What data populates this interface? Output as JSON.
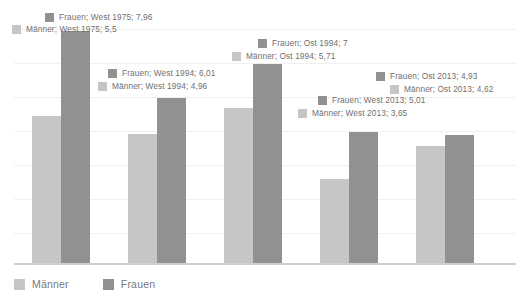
{
  "chart_data": {
    "type": "bar",
    "title": "",
    "subtitle": "",
    "xlabel": "",
    "ylabel": "",
    "grid": true,
    "legend_position": "bottom-left",
    "categories": [
      "West 1975",
      "West 1994",
      "Ost 1994",
      "West 2013",
      "Ost 2013"
    ],
    "series": [
      {
        "name": "Männer",
        "color": "#c6c6c6",
        "values": [
          5.5,
          4.96,
          5.71,
          3.65,
          4.62
        ],
        "value_labels": [
          "5,5",
          "4,96",
          "5,71",
          "3,65",
          "4,62"
        ]
      },
      {
        "name": "Frauen",
        "color": "#919191",
        "values": [
          7.96,
          6.01,
          7,
          5.01,
          4.93
        ],
        "value_labels": [
          "7,96",
          "6,01",
          "7",
          "5,01",
          "4,93"
        ]
      }
    ],
    "ylim": [
      1.2,
      8.0
    ],
    "annotations": [
      "Frauen; West 1975; 7,96",
      "Männer; West 1975; 5,5",
      "Frauen; West 1994; 6,01",
      "Männer; West 1994; 4,96",
      "Frauen; Ost 1994; 7",
      "Männer; Ost 1994; 5,71",
      "Frauen; West 2013; 5,01",
      "Männer; West 2013; 3,65",
      "Frauen; Ost 2013; 4,93",
      "Männer; Ost 2013; 4,62"
    ]
  },
  "callouts": [
    {
      "id": "frauen-west-1975",
      "series": "Frauen",
      "text": "Frauen; West 1975; 7,96",
      "left": 45,
      "top": 12
    },
    {
      "id": "maenner-west-1975",
      "series": "Männer",
      "text": "Männer; West 1975; 5,5",
      "left": 12,
      "top": 24
    },
    {
      "id": "frauen-west-1994",
      "series": "Frauen",
      "text": "Frauen; West 1994; 6,01",
      "left": 108,
      "top": 68
    },
    {
      "id": "maenner-west-1994",
      "series": "Männer",
      "text": "Männer; West 1994; 4,96",
      "left": 98,
      "top": 81
    },
    {
      "id": "frauen-ost-1994",
      "series": "Frauen",
      "text": "Frauen; Ost 1994; 7",
      "left": 258,
      "top": 38
    },
    {
      "id": "maenner-ost-1994",
      "series": "Männer",
      "text": "Männer; Ost 1994; 5,71",
      "left": 232,
      "top": 51
    },
    {
      "id": "frauen-ost-2013",
      "series": "Frauen",
      "text": "Frauen; Ost 2013; 4,93",
      "left": 376,
      "top": 71
    },
    {
      "id": "maenner-ost-2013",
      "series": "Männer",
      "text": "Männer; Ost 2013; 4,62",
      "left": 390,
      "top": 84
    },
    {
      "id": "frauen-west-2013",
      "series": "Frauen",
      "text": "Frauen; West 2013; 5,01",
      "left": 318,
      "top": 95
    },
    {
      "id": "maenner-west-2013",
      "series": "Männer",
      "text": "Männer; West 2013; 3,65",
      "left": 298,
      "top": 108
    }
  ],
  "legend": {
    "items": [
      {
        "label": "Männer",
        "series": "Männer"
      },
      {
        "label": "Frauen",
        "series": "Frauen"
      }
    ]
  },
  "geometry": {
    "gridlines_y": [
      29,
      63,
      97,
      131,
      165,
      199,
      233
    ],
    "baseline_y": 264,
    "px_per_unit": 34.3,
    "value_origin": 1.2,
    "bar_width": 29,
    "group_left": [
      32,
      128,
      224,
      320,
      416
    ]
  }
}
